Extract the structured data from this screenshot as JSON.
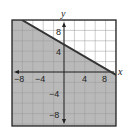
{
  "chart_data": {
    "type": "inequality-graph",
    "title": "",
    "xlabel": "x",
    "ylabel": "y",
    "xlim": [
      -10,
      10
    ],
    "ylim": [
      -10,
      10
    ],
    "grid": true,
    "grid_step": 2,
    "x_tick_labels": [
      "-8",
      "-4",
      "4",
      "8"
    ],
    "y_tick_labels": [
      "8",
      "4",
      "-4",
      "-8"
    ],
    "boundary_line": {
      "points": [
        [
          -8,
          10
        ],
        [
          0,
          5
        ],
        [
          8,
          0
        ]
      ],
      "slope": -0.625,
      "intercept": 5,
      "style": "solid"
    },
    "inequality": "y <= -5/8 x + 5",
    "shaded_region": "below",
    "colors": {
      "shade": "#b9b9b9",
      "line": "#333333",
      "grid": "#9a9a9a",
      "border": "#222222"
    }
  },
  "labels": {
    "x_axis": "x",
    "y_axis": "y",
    "x_ticks": [
      "−8",
      "−4",
      "4",
      "8"
    ],
    "y_ticks": [
      "8",
      "4",
      "−4",
      "−8"
    ]
  }
}
